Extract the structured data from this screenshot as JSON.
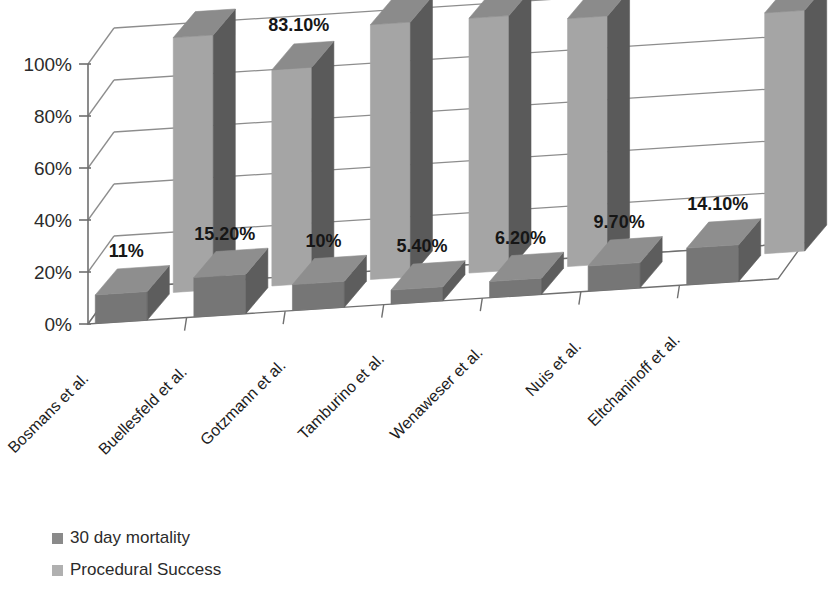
{
  "chart_data": {
    "type": "bar",
    "title": "",
    "subtitle": "",
    "xlabel": "",
    "ylabel": "",
    "ylim": [
      0,
      100
    ],
    "ytick_labels": [
      "0%",
      "20%",
      "40%",
      "60%",
      "80%",
      "100%"
    ],
    "ytick_values": [
      0,
      20,
      40,
      60,
      80,
      100
    ],
    "grid": true,
    "three_d": true,
    "legend_position": "bottom-left",
    "categories": [
      "Bosmans et al.",
      "Buellesfeld et al.",
      "Gotzmann et al.",
      "Tamburino et al.",
      "Wenaweser et al.",
      "Nuis et al.",
      "Eltchaninoff et al."
    ],
    "series": [
      {
        "name": "30 day mortality",
        "color": "#7a7a7a",
        "values": [
          11,
          15.2,
          10,
          5.4,
          6.2,
          9.7,
          14.1
        ],
        "labels": [
          "11%",
          "15.20%",
          "10%",
          "5.40%",
          "6.20%",
          "9.70%",
          "14.10%"
        ]
      },
      {
        "name": "Procedural Success",
        "color": "#a3a3a3",
        "values": [
          98,
          83.1,
          98,
          98,
          95.4,
          null,
          92.6
        ],
        "labels": [
          "98%",
          "83.10%",
          "98%",
          "98%",
          "95.40%",
          "",
          "92.60%"
        ]
      }
    ]
  },
  "legend": {
    "items": [
      {
        "label": "30 day mortality",
        "color": "#8a8a8a"
      },
      {
        "label": "Procedural Success",
        "color": "#b0b0b0"
      }
    ]
  },
  "colors": {
    "bar_front_mortality": "#767676",
    "bar_side_mortality": "#5d5d5d",
    "bar_top_mortality": "#8e8e8e",
    "bar_front_success": "#a5a5a5",
    "bar_side_success": "#5a5a5a",
    "bar_top_success": "#8b8b8b",
    "gridline": "#8d8d8d",
    "axis": "#6f6f6f",
    "floor": "#ffffff",
    "text": "#1d1d1d",
    "background": "#ffffff"
  }
}
